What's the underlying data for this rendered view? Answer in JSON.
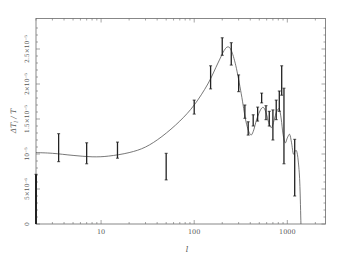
{
  "chart_data": {
    "type": "scatter",
    "title": "",
    "xlabel": "l",
    "ylabel": "ΔT_l / T",
    "xscale": "log",
    "xlim": [
      2,
      2570
    ],
    "ylim": [
      0,
      2.8e-05
    ],
    "grid": false,
    "legend": null,
    "x_ticks": [
      {
        "value": 10,
        "label": "10"
      },
      {
        "value": 100,
        "label": "100"
      },
      {
        "value": 1000,
        "label": "1000"
      }
    ],
    "y_ticks": [
      {
        "value": 0,
        "label": "0"
      },
      {
        "value": 5e-06,
        "label": "5×10⁻⁶"
      },
      {
        "value": 1e-05,
        "label": "10⁻⁵"
      },
      {
        "value": 1.5e-05,
        "label": "1.5×10⁻⁵"
      },
      {
        "value": 2e-05,
        "label": "2×10⁻⁵"
      },
      {
        "value": 2.5e-05,
        "label": "2.5×10⁻⁵"
      }
    ],
    "series": [
      {
        "name": "measurements",
        "kind": "errorbar",
        "unit": "1e-6",
        "points": [
          {
            "l": 2,
            "y": 3.5,
            "lo": 0.0,
            "hi": 7.1
          },
          {
            "l": 3.5,
            "y": 10.9,
            "lo": 8.9,
            "hi": 12.9
          },
          {
            "l": 7,
            "y": 10.1,
            "lo": 8.6,
            "hi": 11.6
          },
          {
            "l": 15,
            "y": 10.6,
            "lo": 9.4,
            "hi": 11.7
          },
          {
            "l": 50,
            "y": 8.2,
            "lo": 6.3,
            "hi": 10.1
          },
          {
            "l": 100,
            "y": 16.7,
            "lo": 15.7,
            "hi": 17.7
          },
          {
            "l": 150,
            "y": 20.9,
            "lo": 19.3,
            "hi": 22.6
          },
          {
            "l": 200,
            "y": 25.4,
            "lo": 24.1,
            "hi": 26.6
          },
          {
            "l": 250,
            "y": 24.3,
            "lo": 22.7,
            "hi": 25.9
          },
          {
            "l": 300,
            "y": 20.1,
            "lo": 18.9,
            "hi": 21.3
          },
          {
            "l": 350,
            "y": 16.1,
            "lo": 15.1,
            "hi": 17.0
          },
          {
            "l": 380,
            "y": 13.6,
            "lo": 12.7,
            "hi": 14.6
          },
          {
            "l": 430,
            "y": 14.8,
            "lo": 14.0,
            "hi": 15.6
          },
          {
            "l": 480,
            "y": 15.7,
            "lo": 14.7,
            "hi": 16.7
          },
          {
            "l": 530,
            "y": 18.0,
            "lo": 17.3,
            "hi": 18.7
          },
          {
            "l": 590,
            "y": 15.9,
            "lo": 14.9,
            "hi": 16.9
          },
          {
            "l": 640,
            "y": 15.1,
            "lo": 14.0,
            "hi": 16.1
          },
          {
            "l": 700,
            "y": 14.2,
            "lo": 12.0,
            "hi": 16.3
          },
          {
            "l": 760,
            "y": 16.3,
            "lo": 14.9,
            "hi": 17.7
          },
          {
            "l": 820,
            "y": 17.6,
            "lo": 16.1,
            "hi": 19.0
          },
          {
            "l": 870,
            "y": 20.5,
            "lo": 18.4,
            "hi": 22.6
          },
          {
            "l": 920,
            "y": 14.0,
            "lo": 8.6,
            "hi": 19.4
          },
          {
            "l": 1200,
            "y": 8.1,
            "lo": 4.0,
            "hi": 12.1
          }
        ]
      },
      {
        "name": "model",
        "kind": "line",
        "unit": "1e-6",
        "points": [
          [
            2,
            10.2
          ],
          [
            3,
            10.1
          ],
          [
            5,
            9.8
          ],
          [
            8,
            9.6
          ],
          [
            12,
            9.7
          ],
          [
            20,
            10.2
          ],
          [
            30,
            11.0
          ],
          [
            45,
            12.5
          ],
          [
            70,
            14.7
          ],
          [
            100,
            17.0
          ],
          [
            140,
            20.0
          ],
          [
            180,
            23.0
          ],
          [
            210,
            24.8
          ],
          [
            230,
            25.3
          ],
          [
            250,
            24.8
          ],
          [
            280,
            22.6
          ],
          [
            320,
            18.6
          ],
          [
            360,
            14.6
          ],
          [
            400,
            12.8
          ],
          [
            430,
            13.2
          ],
          [
            470,
            15.0
          ],
          [
            520,
            16.4
          ],
          [
            560,
            16.6
          ],
          [
            600,
            15.6
          ],
          [
            640,
            14.2
          ],
          [
            680,
            13.8
          ],
          [
            720,
            14.8
          ],
          [
            770,
            16.1
          ],
          [
            820,
            16.4
          ],
          [
            860,
            15.0
          ],
          [
            900,
            12.8
          ],
          [
            950,
            11.6
          ],
          [
            1000,
            12.3
          ],
          [
            1060,
            12.8
          ],
          [
            1110,
            11.6
          ],
          [
            1160,
            10.0
          ],
          [
            1210,
            10.4
          ],
          [
            1260,
            10.4
          ],
          [
            1310,
            9.0
          ],
          [
            1360,
            6.0
          ],
          [
            1400,
            0
          ]
        ]
      }
    ]
  },
  "axes": {
    "xlabel": "l",
    "ylabel_main": "ΔT",
    "ylabel_sub": "l",
    "ylabel_tail": " / T"
  }
}
